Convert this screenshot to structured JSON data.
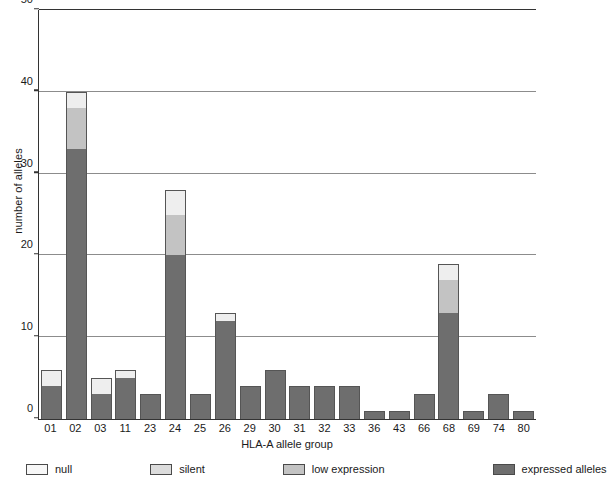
{
  "chart_data": {
    "type": "bar",
    "subtype": "stacked-bar",
    "title": "",
    "xlabel": "HLA-A allele group",
    "ylabel": "number of alleles",
    "ylim": [
      0,
      50
    ],
    "yticks": [
      0,
      10,
      20,
      30,
      40,
      50
    ],
    "ytick_labels": [
      "0",
      "10",
      "20",
      "30",
      "40",
      "50"
    ],
    "grid": "horizontal",
    "legend_position": "bottom",
    "categories": [
      "01",
      "02",
      "03",
      "11",
      "23",
      "24",
      "25",
      "26",
      "29",
      "30",
      "31",
      "32",
      "33",
      "36",
      "43",
      "66",
      "68",
      "69",
      "74",
      "80"
    ],
    "series": [
      {
        "name": "expressed alleles",
        "color": "#6e6e6e",
        "values": [
          4,
          33,
          3,
          5,
          3,
          20,
          3,
          12,
          4,
          6,
          4,
          4,
          4,
          1,
          1,
          3,
          13,
          1,
          3,
          1
        ]
      },
      {
        "name": "low expression",
        "color": "#c3c3c3",
        "values": [
          0,
          5,
          0,
          0,
          0,
          5,
          0,
          0,
          0,
          0,
          0,
          0,
          0,
          0,
          0,
          0,
          4,
          0,
          0,
          0
        ]
      },
      {
        "name": "silent",
        "color": "#dcdcdc",
        "values": [
          0,
          0,
          0,
          0,
          0,
          0,
          0,
          0,
          0,
          0,
          0,
          0,
          0,
          0,
          0,
          0,
          0,
          0,
          0,
          0
        ]
      },
      {
        "name": "null",
        "color": "#eeeeee",
        "values": [
          2,
          2,
          2,
          1,
          0,
          3,
          0,
          1,
          0,
          0,
          0,
          0,
          0,
          0,
          0,
          0,
          2,
          0,
          0,
          0
        ]
      }
    ],
    "totals": [
      6,
      40,
      5,
      6,
      3,
      28,
      3,
      13,
      4,
      6,
      4,
      4,
      4,
      1,
      1,
      3,
      19,
      1,
      3,
      1
    ]
  },
  "legend": {
    "items": [
      {
        "label": "null",
        "color": "#f7f7f7"
      },
      {
        "label": "silent",
        "color": "#dcdcdc"
      },
      {
        "label": "low expression",
        "color": "#c3c3c3"
      },
      {
        "label": "expressed alleles",
        "color": "#6e6e6e"
      }
    ]
  }
}
